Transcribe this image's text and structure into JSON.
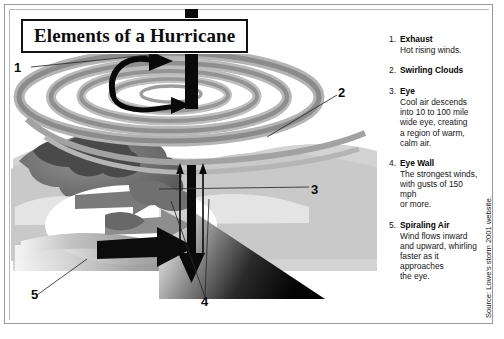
{
  "figure": {
    "title": "Elements of a Hurricane",
    "source_credit": "Source: Lowe's storm 2001 website."
  },
  "callouts": [
    {
      "id": "callout-1",
      "label": "1"
    },
    {
      "id": "callout-2",
      "label": "2"
    },
    {
      "id": "callout-3",
      "label": "3"
    },
    {
      "id": "callout-4",
      "label": "4"
    },
    {
      "id": "callout-5",
      "label": "5"
    }
  ],
  "legend": {
    "items": [
      {
        "number": "1.",
        "term": "Exhaust",
        "description": "Hot rising winds."
      },
      {
        "number": "2.",
        "term": "Swirling Clouds",
        "description": ""
      },
      {
        "number": "3.",
        "term": "Eye",
        "description": "Cool air descends\ninto 10 to 100 mile\nwide eye, creating\na region of warm,\ncalm air."
      },
      {
        "number": "4.",
        "term": "Eye Wall",
        "description": "The strongest winds,\nwith gusts of 150 mph\nor more."
      },
      {
        "number": "5.",
        "term": "Spiraling Air",
        "description": "Wind flows inward\nand upward, whirling\nfaster as it approaches\nthe eye."
      }
    ]
  },
  "colors": {
    "ink": "#0d0d0d",
    "cloud_light": "#d8d8d8",
    "cloud_mid": "#a8a8a8",
    "cloud_dark": "#6e6e6e",
    "cloud_darkest": "#3a3a3a",
    "frame": "#9a9a9a",
    "paper": "#ffffff"
  }
}
